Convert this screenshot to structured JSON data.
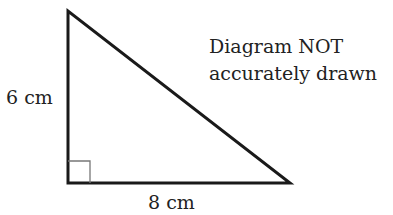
{
  "diagram": {
    "type": "right-triangle",
    "vertices": {
      "top": [
        68,
        11
      ],
      "right_angle": [
        68,
        183
      ],
      "right": [
        290,
        183
      ]
    },
    "right_angle_marker_size": 22,
    "line_color": "#1a1a1a",
    "marker_color": "#777777",
    "labels": {
      "vertical_side": "6 cm",
      "horizontal_side": "8 cm"
    },
    "note": {
      "line1": "Diagram NOT",
      "line2": "accurately drawn"
    }
  }
}
